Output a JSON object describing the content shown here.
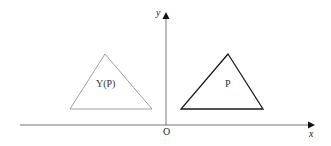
{
  "diagram": {
    "axes": {
      "x_label": "x",
      "y_label": "y",
      "origin_label": "O",
      "color": "#555555"
    },
    "shapes": [
      {
        "id": "yp",
        "label": "Y(P)",
        "type": "triangle",
        "stroke": "#8a8a8a",
        "stroke_width": 0.8,
        "points": [
          [
            105,
            54
          ],
          [
            70,
            109
          ],
          [
            152,
            109
          ]
        ]
      },
      {
        "id": "p",
        "label": "P",
        "type": "triangle",
        "stroke": "#1a1a1a",
        "stroke_width": 1.3,
        "points": [
          [
            228,
            54
          ],
          [
            181,
            109
          ],
          [
            263,
            109
          ]
        ]
      }
    ]
  }
}
